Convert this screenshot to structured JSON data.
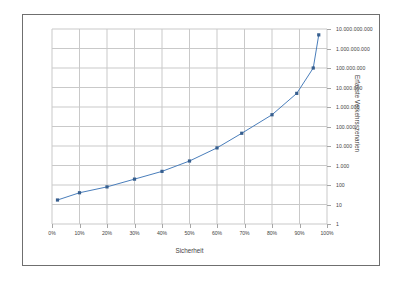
{
  "chart_data": {
    "type": "line",
    "title": "",
    "xlabel": "Sicherheit",
    "ylabel": "Erfasste Verkehrsszenarien",
    "yscale": "log",
    "xlim": [
      0,
      100
    ],
    "ylim": [
      1,
      10000000000
    ],
    "grid": true,
    "legend": "none",
    "series_name": "Erfasste Verkehrsszenarien",
    "line_color": "#4a7ebb",
    "marker_color": "#365e8e",
    "x_ticklabels": [
      "0%",
      "10%",
      "20%",
      "30%",
      "40%",
      "50%",
      "60%",
      "70%",
      "80%",
      "90%",
      "100%"
    ],
    "x_tickvalues": [
      0,
      10,
      20,
      30,
      40,
      50,
      60,
      70,
      80,
      90,
      100
    ],
    "y_ticklabels": [
      "1",
      "10",
      "100",
      "1.000",
      "10.000",
      "100.000",
      "1.000.000",
      "10.000.000",
      "100.000.000",
      "1.000.000.000",
      "10.000.000.000"
    ],
    "y_tickvalues": [
      1,
      10,
      100,
      1000,
      10000,
      100000,
      1000000,
      10000000,
      100000000,
      1000000000,
      10000000000
    ],
    "x": [
      2,
      10,
      20,
      30,
      40,
      50,
      60,
      69,
      80,
      89,
      95,
      97
    ],
    "values": [
      17,
      40,
      80,
      200,
      500,
      1700,
      8000,
      45000,
      400000,
      5000000,
      100000000,
      5000000000
    ],
    "points": [
      {
        "x": 2,
        "y": 17
      },
      {
        "x": 10,
        "y": 40
      },
      {
        "x": 20,
        "y": 80
      },
      {
        "x": 30,
        "y": 200
      },
      {
        "x": 40,
        "y": 500
      },
      {
        "x": 50,
        "y": 1700
      },
      {
        "x": 60,
        "y": 8000
      },
      {
        "x": 69,
        "y": 45000
      },
      {
        "x": 80,
        "y": 400000
      },
      {
        "x": 89,
        "y": 5000000
      },
      {
        "x": 95,
        "y": 100000000
      },
      {
        "x": 97,
        "y": 5000000000
      }
    ]
  },
  "figure": {
    "border_color": "#6f6f6f",
    "background": "#ffffff"
  }
}
